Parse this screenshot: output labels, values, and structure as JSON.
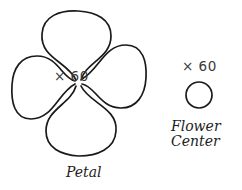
{
  "figure": {
    "background_color": "#ffffff",
    "stroke_color": "#1a1a1a",
    "text_color": "#1d1d1d",
    "quantity_text_color": "#3a3a3a"
  },
  "parts": [
    {
      "id": "petal",
      "name": "Petal",
      "quantity_label": "× 60",
      "quantity_value": 60,
      "shape": "four-lobed-flower-outline",
      "icon_name": "petal-shape-icon"
    },
    {
      "id": "flower-center",
      "name": "Flower\nCenter",
      "name_line1": "Flower",
      "name_line2": "Center",
      "quantity_label": "× 60",
      "quantity_value": 60,
      "shape": "circle",
      "icon_name": "flower-center-circle-icon"
    }
  ]
}
